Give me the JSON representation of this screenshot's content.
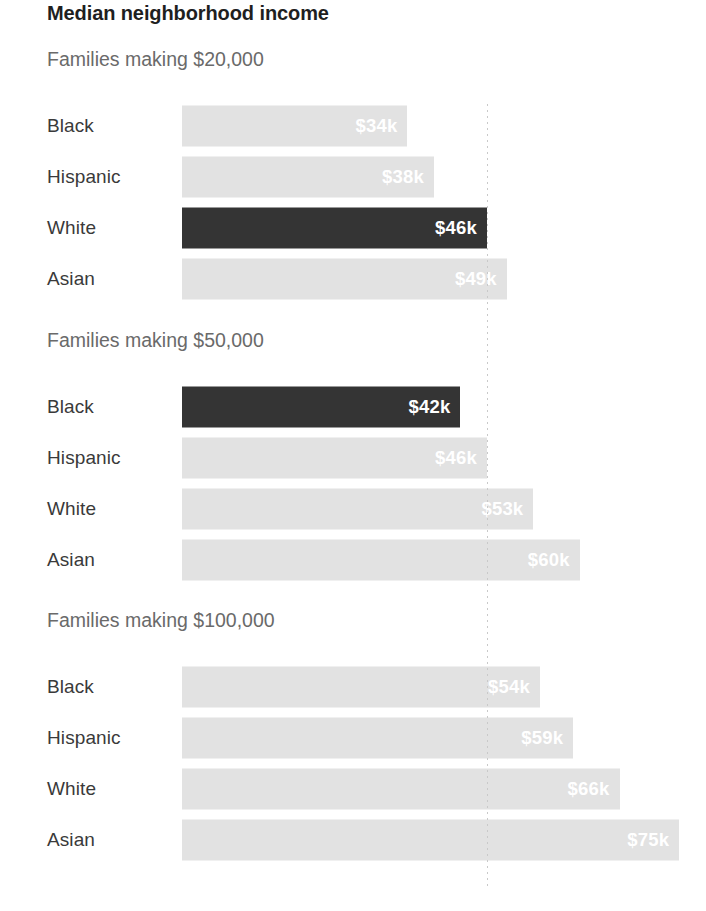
{
  "chart_data": {
    "type": "bar",
    "title": "Median neighborhood income",
    "xlabel": "",
    "ylabel": "",
    "orientation": "horizontal",
    "value_unit": "thousands of dollars",
    "grid": false,
    "legend": "none",
    "xlim": [
      0,
      76
    ],
    "reference_line": {
      "value": 46,
      "style": "dotted",
      "color": "#c9c9c9"
    },
    "categories": [
      "Black",
      "Hispanic",
      "White",
      "Asian"
    ],
    "groups": [
      {
        "label": "Families making $20,000",
        "bars": [
          {
            "category": "Black",
            "value": 34,
            "value_label": "$34k",
            "highlight": false
          },
          {
            "category": "Hispanic",
            "value": 38,
            "value_label": "$38k",
            "highlight": false
          },
          {
            "category": "White",
            "value": 46,
            "value_label": "$46k",
            "highlight": true
          },
          {
            "category": "Asian",
            "value": 49,
            "value_label": "$49k",
            "highlight": false
          }
        ]
      },
      {
        "label": "Families making $50,000",
        "bars": [
          {
            "category": "Black",
            "value": 42,
            "value_label": "$42k",
            "highlight": true
          },
          {
            "category": "Hispanic",
            "value": 46,
            "value_label": "$46k",
            "highlight": false
          },
          {
            "category": "White",
            "value": 53,
            "value_label": "$53k",
            "highlight": false
          },
          {
            "category": "Asian",
            "value": 60,
            "value_label": "$60k",
            "highlight": false
          }
        ]
      },
      {
        "label": "Families making $100,000",
        "bars": [
          {
            "category": "Black",
            "value": 54,
            "value_label": "$54k",
            "highlight": false
          },
          {
            "category": "Hispanic",
            "value": 59,
            "value_label": "$59k",
            "highlight": false
          },
          {
            "category": "White",
            "value": 66,
            "value_label": "$66k",
            "highlight": false
          },
          {
            "category": "Asian",
            "value": 75,
            "value_label": "$75k",
            "highlight": false
          }
        ]
      }
    ],
    "colors": {
      "bar_default": "#e2e2e2",
      "bar_highlight": "#343434",
      "value_text": "#ffffff",
      "title_text": "#1f1f1f",
      "group_label_text": "#6a6a6a",
      "category_label_text": "#3a3a3a",
      "background": "#ffffff"
    }
  }
}
